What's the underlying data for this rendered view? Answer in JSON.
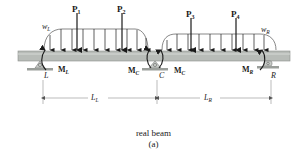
{
  "figure": {
    "caption": "real beam",
    "sublabel": "(a)"
  },
  "loads": {
    "point_loads": [
      "P1",
      "P2",
      "P3",
      "P4"
    ],
    "distributed_left": "wL",
    "distributed_right": "wR"
  },
  "moments": {
    "left": "ML",
    "center_left": "MC",
    "center_right": "MC",
    "right": "MR"
  },
  "supports": {
    "left": "L",
    "center": "C",
    "right": "R"
  },
  "dimensions": {
    "left_span": "LL",
    "right_span": "LR"
  },
  "colors": {
    "beam": "#b8bcb8",
    "beam_edge": "#8a8e8a",
    "support": "#c8ccc8",
    "ground": "#9a9e9a",
    "ink": "#1a1a1a"
  }
}
